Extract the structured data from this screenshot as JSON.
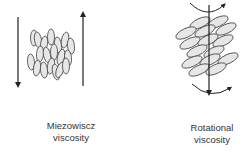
{
  "diagram": {
    "panels": [
      {
        "id": "miezowiscz",
        "label_line1": "Miezowiscz",
        "label_line2": "viscosity",
        "elements": [
          "down-arrow-left",
          "up-arrow-right",
          "vertical-ellipse-cluster"
        ]
      },
      {
        "id": "rotational",
        "label_line1": "Rotational",
        "label_line2": "viscosity",
        "elements": [
          "vertical-axis-arrow",
          "tilted-ellipse-stack",
          "top-curved-rotation-arrow",
          "bottom-curved-rotation-arrow"
        ]
      }
    ],
    "colors": {
      "stroke": "#333333",
      "ellipse_fill": "#e6e6e6",
      "background": "#ffffff"
    }
  }
}
